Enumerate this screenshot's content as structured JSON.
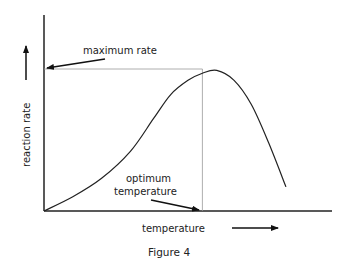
{
  "figure": {
    "caption": "Figure 4",
    "x_axis_label": "temperature",
    "y_axis_label": "reaction rate",
    "annotations": {
      "maximum_rate": "maximum rate",
      "optimum_line1": "optimum",
      "optimum_line2": "temperature"
    }
  },
  "chart_data": {
    "type": "line",
    "title": "",
    "caption": "Figure 4",
    "xlabel": "temperature",
    "ylabel": "reaction rate",
    "xlim": [
      0,
      100
    ],
    "ylim": [
      0,
      100
    ],
    "grid": false,
    "legend": "none",
    "series": [
      {
        "name": "reaction rate vs temperature",
        "x": [
          0,
          10,
          20,
          30,
          38,
          44,
          50,
          55,
          60,
          66,
          72,
          78,
          84
        ],
        "y": [
          0,
          10,
          23,
          42,
          65,
          82,
          92,
          97,
          99,
          92,
          75,
          48,
          17
        ]
      }
    ],
    "annotations": [
      {
        "text": "maximum rate",
        "points_to": "y-axis at maximum rate",
        "y": 100
      },
      {
        "text": "optimum temperature",
        "points_to": "x-axis at optimum temperature",
        "x": 55
      }
    ],
    "optimum": {
      "x": 55,
      "y": 100
    }
  }
}
